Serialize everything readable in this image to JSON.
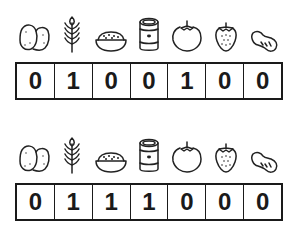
{
  "icons": [
    {
      "name": "potato-icon",
      "label": "potatoes"
    },
    {
      "name": "wheat-icon",
      "label": "wheat"
    },
    {
      "name": "grain-bowl-icon",
      "label": "bowl of cereal"
    },
    {
      "name": "bean-can-icon",
      "label": "canned beans"
    },
    {
      "name": "tomato-icon",
      "label": "tomato"
    },
    {
      "name": "strawberry-icon",
      "label": "strawberry"
    },
    {
      "name": "peanut-icon",
      "label": "peanut"
    }
  ],
  "rows": [
    {
      "bits": [
        "0",
        "1",
        "0",
        "0",
        "1",
        "0",
        "0"
      ]
    },
    {
      "bits": [
        "0",
        "1",
        "1",
        "1",
        "0",
        "0",
        "0"
      ]
    }
  ],
  "colors": {
    "stroke": "#1a1a1a",
    "background": "#ffffff"
  }
}
